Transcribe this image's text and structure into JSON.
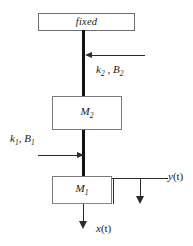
{
  "diagram": {
    "title_text": "fixed",
    "masses": [
      {
        "name": "mass-2",
        "symbol": "M",
        "subscript": "2"
      },
      {
        "name": "mass-1",
        "symbol": "M",
        "subscript": "1"
      }
    ],
    "annotations": {
      "upper_spring_damper": {
        "spring_symbol": "k",
        "spring_subscript": "2",
        "separator": " , ",
        "damper_symbol": "B",
        "damper_subscript": "2"
      },
      "lower_spring_damper": {
        "spring_symbol": "k",
        "spring_subscript": "1",
        "separator": ", ",
        "damper_symbol": "B",
        "damper_subscript": "1"
      },
      "output_displacement": {
        "symbol": "y",
        "argument": "(t)"
      },
      "input_displacement": {
        "symbol": "x",
        "argument": "(t)"
      }
    },
    "colors": {
      "background": "#fefefe",
      "box_border": "#7a7a80",
      "rod": "#111111",
      "line": "#2b2b2b",
      "text": "#1b1b1b"
    },
    "icons": {
      "arrow_left": "arrow-left-icon",
      "arrow_right": "arrow-right-icon",
      "arrow_down": "arrow-down-icon"
    }
  }
}
